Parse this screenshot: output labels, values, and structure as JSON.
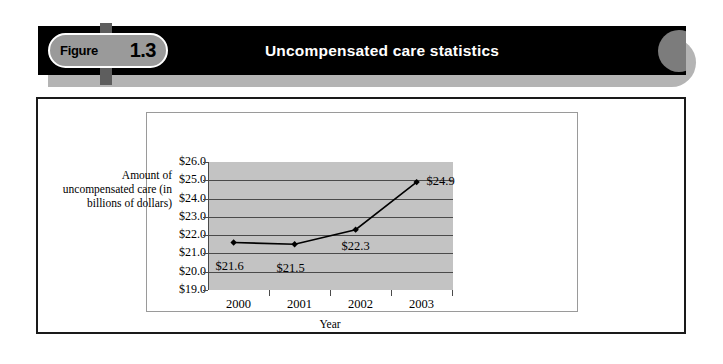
{
  "header": {
    "figure_word": "Figure",
    "figure_number": "1.3",
    "title": "Uncompensated care statistics",
    "bar_color": "#000000",
    "badge_fill": "#9a9a9a",
    "accent_gray": "#5e5e5e",
    "shadow_gray": "#b4b4b4"
  },
  "chart_data": {
    "type": "line",
    "title": "Uncompensated care statistics",
    "xlabel": "Year",
    "ylabel": "Amount of uncompensated care (in billions of dollars)",
    "categories": [
      "2000",
      "2001",
      "2002",
      "2003"
    ],
    "values": [
      21.6,
      21.5,
      22.3,
      24.9
    ],
    "point_labels": [
      "$21.6",
      "$21.5",
      "$22.3",
      "$24.9"
    ],
    "ylim": [
      19.0,
      26.0
    ],
    "ytick_labels": [
      "$26.0",
      "$25.0",
      "$24.0",
      "$23.0",
      "$22.0",
      "$21.0",
      "$20.0",
      "$19.0"
    ],
    "ytick_values": [
      26.0,
      25.0,
      24.0,
      23.0,
      22.0,
      21.0,
      20.0,
      19.0
    ],
    "grid": true,
    "legend": "none",
    "plot_bg_color": "#c3c3c3",
    "line_color": "#000000",
    "marker": "diamond"
  }
}
